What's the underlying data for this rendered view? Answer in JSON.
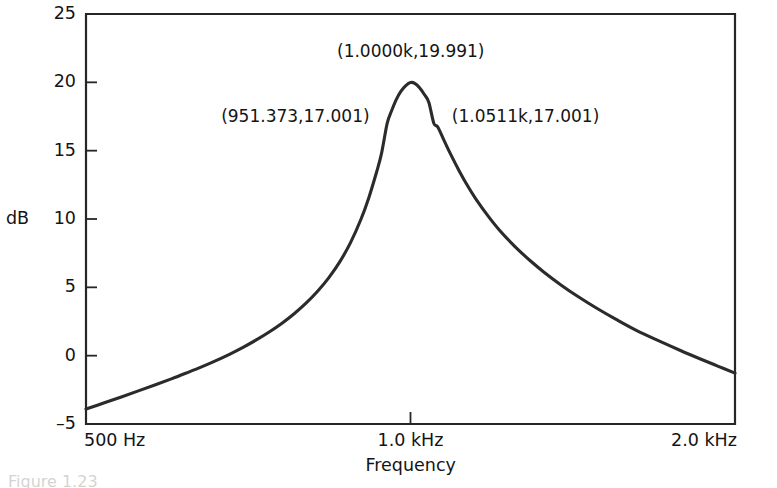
{
  "chart_data": {
    "type": "line",
    "title": "",
    "xlabel": "Frequency",
    "ylabel": "dB",
    "x_scale": "log",
    "xlim": [
      500,
      2000
    ],
    "ylim": [
      -5,
      25
    ],
    "grid": false,
    "legend": "none",
    "x_tick_labels": [
      "500 Hz",
      "1.0 kHz",
      "2.0 kHz"
    ],
    "x_tick_values": [
      500,
      1000,
      2000
    ],
    "y_tick_labels": [
      "25",
      "20",
      "15",
      "10",
      "5",
      "0",
      "-5"
    ],
    "y_tick_values": [
      25,
      20,
      15,
      10,
      5,
      0,
      -5
    ],
    "annotations": [
      {
        "text": "(1.0000k,19.991)",
        "x": 1000.0,
        "y": 19.991
      },
      {
        "text": "(951.373,17.001)",
        "x": 951.373,
        "y": 17.001
      },
      {
        "text": "(1.0511k,17.001)",
        "x": 1051.1,
        "y": 17.001
      }
    ],
    "series": [
      {
        "name": "Magnitude response",
        "x": [
          500,
          520,
          540,
          560,
          580,
          600,
          620,
          640,
          660,
          680,
          700,
          720,
          740,
          760,
          780,
          800,
          820,
          840,
          860,
          880,
          900,
          915,
          930,
          940,
          951.373,
          960,
          970,
          980,
          990,
          1000,
          1010,
          1020,
          1030,
          1040,
          1051.1,
          1060,
          1075,
          1090,
          1110,
          1130,
          1150,
          1180,
          1210,
          1250,
          1290,
          1330,
          1380,
          1430,
          1490,
          1550,
          1620,
          1700,
          1780,
          1860,
          1930,
          2000
        ],
        "y": [
          -3.9,
          -3.45,
          -3.0,
          -2.56,
          -2.13,
          -1.7,
          -1.26,
          -0.82,
          -0.36,
          0.12,
          0.63,
          1.17,
          1.75,
          2.38,
          3.07,
          3.84,
          4.71,
          5.71,
          6.88,
          8.29,
          10.02,
          11.58,
          13.42,
          14.8,
          17.0,
          17.88,
          18.74,
          19.35,
          19.76,
          19.99,
          19.91,
          19.59,
          19.11,
          18.53,
          17.0,
          16.73,
          15.7,
          14.71,
          13.5,
          12.41,
          11.46,
          10.23,
          9.16,
          7.98,
          6.98,
          6.11,
          5.16,
          4.33,
          3.45,
          2.67,
          1.85,
          1.08,
          0.38,
          -0.26,
          -0.78,
          -1.28
        ]
      }
    ]
  },
  "figure": {
    "caption_sliver": "Figure 1.23"
  },
  "colors": {
    "curve": "#2b2b2b",
    "axis": "#262626",
    "text": "#141414",
    "background": "#ffffff"
  }
}
